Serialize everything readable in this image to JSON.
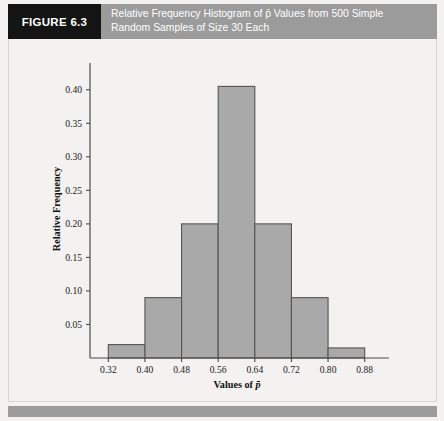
{
  "figure": {
    "number_label": "FIGURE 6.3",
    "caption_line_1": "Relative Frequency Histogram of p̄ Values from 500 Simple",
    "caption_line_2": "Random Samples of Size 30 Each",
    "header_bg": "#9b9b9b",
    "number_box_bg": "#141414",
    "panel_bg": "#f3f2f0",
    "footer_bg": "#9b9b9b"
  },
  "chart_data": {
    "type": "bar",
    "title": "Relative Frequency Histogram of p̄ Values from 500 Simple Random Samples of Size 30 Each",
    "xlabel": "Values of p̄",
    "ylabel": "Relative Frequency",
    "bin_edges": [
      0.32,
      0.4,
      0.48,
      0.56,
      0.64,
      0.72,
      0.8,
      0.88
    ],
    "categories": [
      "0.32-0.40",
      "0.40-0.48",
      "0.48-0.56",
      "0.56-0.64",
      "0.64-0.72",
      "0.72-0.80",
      "0.80-0.88"
    ],
    "values": [
      0.02,
      0.09,
      0.2,
      0.405,
      0.2,
      0.09,
      0.015
    ],
    "xlim": [
      0.28,
      0.92
    ],
    "ylim": [
      0.0,
      0.425
    ],
    "xticks": [
      "0.32",
      "0.40",
      "0.48",
      "0.56",
      "0.64",
      "0.72",
      "0.80",
      "0.88"
    ],
    "xtick_values": [
      0.32,
      0.4,
      0.48,
      0.56,
      0.64,
      0.72,
      0.8,
      0.88
    ],
    "yticks": [
      "0.05",
      "0.10",
      "0.15",
      "0.20",
      "0.25",
      "0.30",
      "0.35",
      "0.40"
    ],
    "ytick_values": [
      0.05,
      0.1,
      0.15,
      0.2,
      0.25,
      0.3,
      0.35,
      0.4
    ],
    "grid": false,
    "legend": null,
    "bar_fill": "#a9a9a9",
    "bar_stroke": "#555555",
    "sample_count": 500,
    "sample_size": 30
  }
}
